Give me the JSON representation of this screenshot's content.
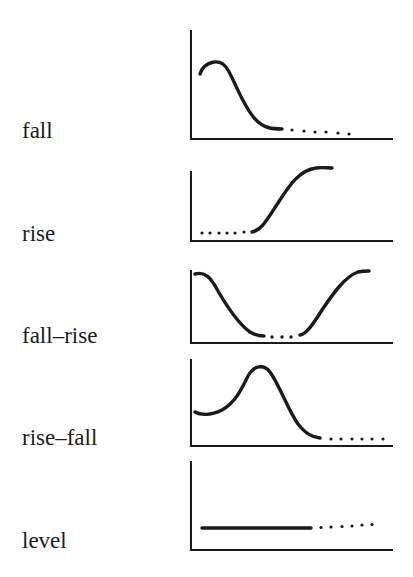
{
  "figure": {
    "colors": {
      "ink": "#1a1a1a",
      "background": "#ffffff"
    },
    "panels": [
      {
        "id": "fall",
        "label": "fall"
      },
      {
        "id": "rise",
        "label": "rise"
      },
      {
        "id": "fall-rise",
        "label": "fall–rise"
      },
      {
        "id": "rise-fall",
        "label": "rise–fall"
      },
      {
        "id": "level",
        "label": "level"
      }
    ]
  }
}
